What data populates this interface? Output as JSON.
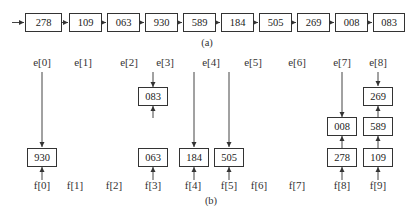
{
  "figure_a": {
    "caption": "(a)",
    "list": [
      "278",
      "109",
      "063",
      "930",
      "589",
      "184",
      "505",
      "269",
      "008",
      "083"
    ]
  },
  "figure_b": {
    "caption": "(b)",
    "e_labels": [
      "e[0]",
      "e[1]",
      "e[2]",
      "e[3]",
      "e[4]",
      "e[5]",
      "e[6]",
      "e[7]",
      "e[8]"
    ],
    "f_labels": [
      "f[0]",
      "f[1]",
      "f[2]",
      "f[3]",
      "f[4]",
      "f[5]",
      "f[6]",
      "f[7]",
      "f[8]",
      "f[9]"
    ],
    "buckets": [
      {
        "f": "f[0]",
        "e": "e[0]",
        "items": [
          "930"
        ]
      },
      {
        "f": "f[3]",
        "e": "e[3]",
        "items": [
          "063",
          "083"
        ]
      },
      {
        "f": "f[4]",
        "e": "e[4]",
        "items": [
          "184"
        ]
      },
      {
        "f": "f[5]",
        "e": "e[5]",
        "items": [
          "505"
        ]
      },
      {
        "f": "f[8]",
        "e": "e[7]",
        "items": [
          "278",
          "008"
        ]
      },
      {
        "f": "f[9]",
        "e": "e[8]",
        "items": [
          "109",
          "589",
          "269"
        ]
      }
    ]
  }
}
